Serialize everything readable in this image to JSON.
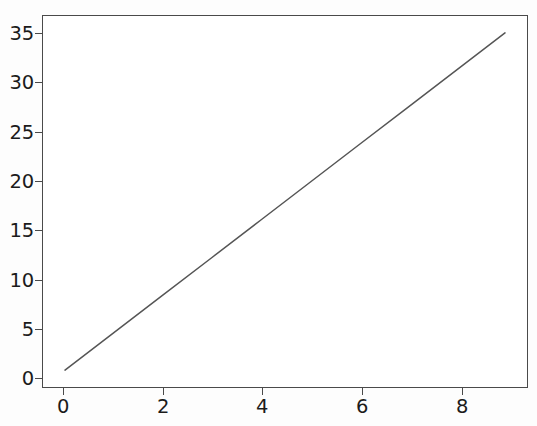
{
  "chart_data": {
    "type": "line",
    "title": "",
    "subtitle": "",
    "xlabel": "",
    "ylabel": "",
    "x": [
      0,
      1,
      2,
      3,
      4,
      5,
      6,
      7,
      8,
      9
    ],
    "series": [
      {
        "name": "",
        "values": [
          0,
          4,
          8,
          12,
          16,
          20,
          24,
          28,
          32,
          36
        ],
        "color": "#555555",
        "linewidth": 1.5,
        "linestyle": "solid",
        "marker": "none"
      }
    ],
    "xlim": [
      -0.45,
      9.45
    ],
    "ylim": [
      -1.8,
      37.8
    ],
    "xticks": [
      0,
      2,
      4,
      6,
      8
    ],
    "yticks": [
      0,
      5,
      10,
      15,
      20,
      25,
      30,
      35
    ],
    "xtick_labels": [
      "0",
      "2",
      "4",
      "6",
      "8"
    ],
    "ytick_labels": [
      "0",
      "5",
      "10",
      "15",
      "20",
      "25",
      "30",
      "35"
    ],
    "grid": false,
    "legend": null,
    "legend_position": "none",
    "annotations": [],
    "frame_color": "#4a4a4a",
    "background_color": "#ffffff",
    "tick_label_color": "#1b1b1b"
  },
  "figure": {
    "width": 537,
    "height": 426,
    "facecolor": "#fdfdfd"
  }
}
